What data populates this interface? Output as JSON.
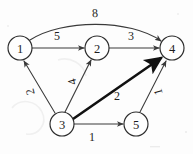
{
  "diagram": {
    "background_color": "#fdfdfd",
    "ink_color": "#2b2b2b",
    "nodes": [
      {
        "id": "1",
        "label": "1",
        "cx": 20,
        "cy": 48,
        "r": 12
      },
      {
        "id": "2",
        "label": "2",
        "cx": 97,
        "cy": 48,
        "r": 12
      },
      {
        "id": "3",
        "label": "3",
        "cx": 62,
        "cy": 124,
        "r": 12
      },
      {
        "id": "4",
        "label": "4",
        "cx": 172,
        "cy": 48,
        "r": 12
      },
      {
        "id": "5",
        "label": "5",
        "cx": 136,
        "cy": 124,
        "r": 12
      }
    ],
    "edges": [
      {
        "from": "1",
        "to": "4",
        "weight": "8",
        "style": "curved",
        "emphasis": "normal",
        "label_x": 95,
        "label_y": 13
      },
      {
        "from": "1",
        "to": "2",
        "weight": "5",
        "style": "straight",
        "emphasis": "normal",
        "label_x": 57,
        "label_y": 36
      },
      {
        "from": "2",
        "to": "4",
        "weight": "3",
        "style": "straight",
        "emphasis": "normal",
        "label_x": 131,
        "label_y": 36
      },
      {
        "from": "3",
        "to": "1",
        "weight": "2",
        "style": "straight",
        "emphasis": "normal",
        "label_x": 30,
        "label_y": 92,
        "label_rotation": -105
      },
      {
        "from": "3",
        "to": "2",
        "weight": "4",
        "style": "straight",
        "emphasis": "normal",
        "label_x": 72,
        "label_y": 82,
        "label_rotation": -105
      },
      {
        "from": "3",
        "to": "4",
        "weight": "2",
        "style": "straight",
        "emphasis": "bold",
        "label_x": 117,
        "label_y": 96
      },
      {
        "from": "3",
        "to": "5",
        "weight": "1",
        "style": "straight",
        "emphasis": "normal",
        "label_x": 92,
        "label_y": 137
      },
      {
        "from": "5",
        "to": "4",
        "weight": "1",
        "style": "straight",
        "emphasis": "normal",
        "label_x": 158,
        "label_y": 92,
        "label_rotation": -105
      }
    ]
  }
}
